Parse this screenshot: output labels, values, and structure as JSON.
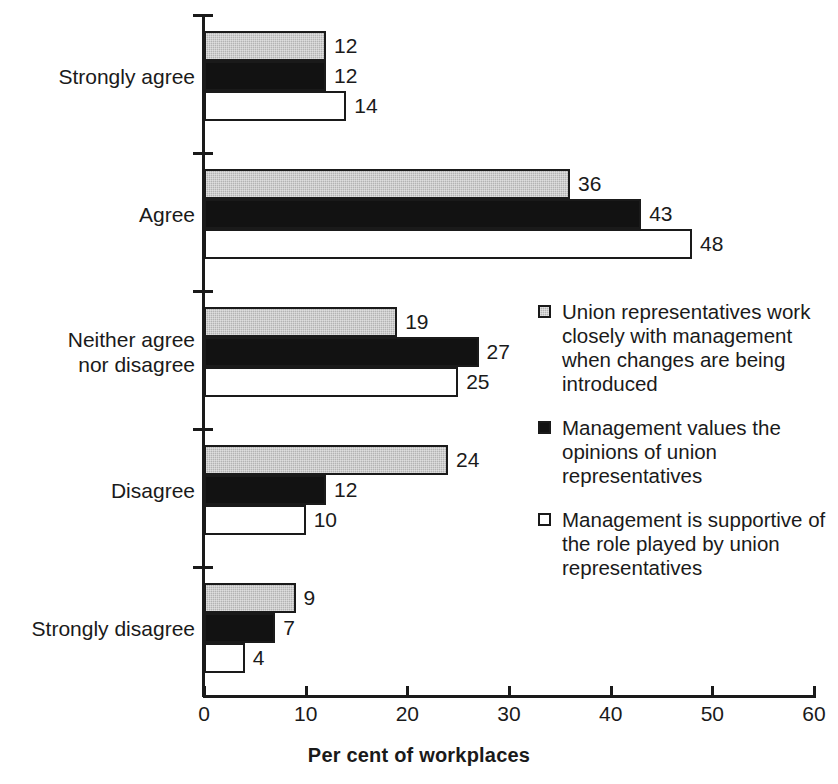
{
  "chart_data": {
    "type": "bar",
    "orientation": "horizontal",
    "title": "",
    "xlabel": "Per cent of workplaces",
    "ylabel": "",
    "xlim": [
      0,
      60
    ],
    "xticks": [
      0,
      10,
      20,
      30,
      40,
      50,
      60
    ],
    "grid": false,
    "legend_position": "right-middle",
    "categories": [
      "Strongly agree",
      "Agree",
      "Neither agree\nnor disagree",
      "Disagree",
      "Strongly disagree"
    ],
    "series": [
      {
        "name": "Union representatives work closely with management when changes are being introduced",
        "color": "#b3b3b3",
        "values": [
          12,
          36,
          19,
          24,
          9
        ]
      },
      {
        "name": "Management values the opinions of union representatives",
        "color": "#121212",
        "values": [
          12,
          43,
          27,
          12,
          7
        ]
      },
      {
        "name": "Management is supportive of the role played by union representatives",
        "color": "#ffffff",
        "values": [
          14,
          48,
          25,
          10,
          4
        ]
      }
    ]
  },
  "axis": {
    "x_tick_labels": [
      "0",
      "10",
      "20",
      "30",
      "40",
      "50",
      "60"
    ],
    "x_title": "Per cent of workplaces"
  },
  "legend": {
    "items": [
      {
        "swatch": "gray-swatch",
        "label": "Union representatives work closely with management when changes are being introduced"
      },
      {
        "swatch": "black-swatch",
        "label": "Management values the opinions of union representatives"
      },
      {
        "swatch": "white-swatch",
        "label": "Management is supportive of the role played by union representatives"
      }
    ]
  }
}
